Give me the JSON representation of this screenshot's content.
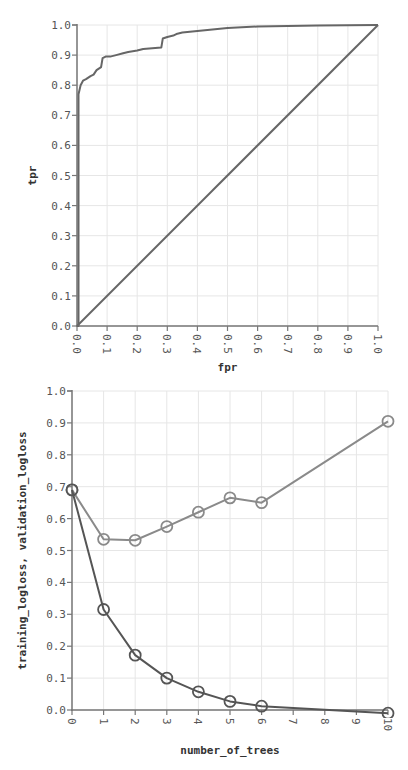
{
  "chart_data": [
    {
      "type": "line",
      "title": "",
      "xlabel": "fpr",
      "ylabel": "tpr",
      "xlim": [
        0,
        1
      ],
      "ylim": [
        0,
        1
      ],
      "grid": true,
      "xticks": [
        "0.0",
        "0.1",
        "0.2",
        "0.3",
        "0.4",
        "0.5",
        "0.6",
        "0.7",
        "0.8",
        "0.9",
        "1.0"
      ],
      "yticks": [
        "0.0",
        "0.1",
        "0.2",
        "0.3",
        "0.4",
        "0.5",
        "0.6",
        "0.7",
        "0.8",
        "0.9",
        "1.0"
      ],
      "series": [
        {
          "name": "roc",
          "color": "#666666",
          "x": [
            0.0,
            0.0,
            0.005,
            0.005,
            0.012,
            0.02,
            0.03,
            0.045,
            0.055,
            0.065,
            0.08,
            0.085,
            0.095,
            0.11,
            0.13,
            0.15,
            0.17,
            0.2,
            0.22,
            0.28,
            0.285,
            0.3,
            0.32,
            0.33,
            0.35,
            0.4,
            0.45,
            0.5,
            0.6,
            0.7,
            0.8,
            0.9,
            1.0
          ],
          "y": [
            0.0,
            0.0,
            0.0,
            0.77,
            0.8,
            0.815,
            0.82,
            0.83,
            0.835,
            0.85,
            0.86,
            0.89,
            0.895,
            0.895,
            0.9,
            0.905,
            0.91,
            0.915,
            0.92,
            0.925,
            0.955,
            0.96,
            0.965,
            0.97,
            0.975,
            0.98,
            0.985,
            0.99,
            0.995,
            0.997,
            0.998,
            0.999,
            1.0
          ]
        },
        {
          "name": "diagonal",
          "color": "#666666",
          "x": [
            0.0,
            1.0
          ],
          "y": [
            0.0,
            1.0
          ]
        }
      ]
    },
    {
      "type": "line",
      "title": "",
      "xlabel": "number_of_trees",
      "ylabel": "training_logloss, validation_logloss",
      "xlim": [
        0,
        10
      ],
      "ylim": [
        0,
        1
      ],
      "grid": true,
      "xticks": [
        "0",
        "1",
        "2",
        "3",
        "4",
        "5",
        "6",
        "7",
        "8",
        "9",
        "10"
      ],
      "yticks": [
        "0.0",
        "0.1",
        "0.2",
        "0.3",
        "0.4",
        "0.5",
        "0.6",
        "0.7",
        "0.8",
        "0.9",
        "1.0"
      ],
      "series": [
        {
          "name": "validation_logloss",
          "color": "#8a8a8a",
          "x": [
            0,
            1,
            2,
            3,
            4,
            5,
            6,
            10
          ],
          "y": [
            0.69,
            0.535,
            0.532,
            0.575,
            0.62,
            0.665,
            0.65,
            0.905
          ]
        },
        {
          "name": "training_logloss",
          "color": "#555555",
          "x": [
            0,
            1,
            2,
            3,
            4,
            5,
            6,
            10
          ],
          "y": [
            0.69,
            0.315,
            0.172,
            0.1,
            0.057,
            0.027,
            0.012,
            -0.01
          ]
        }
      ]
    }
  ]
}
